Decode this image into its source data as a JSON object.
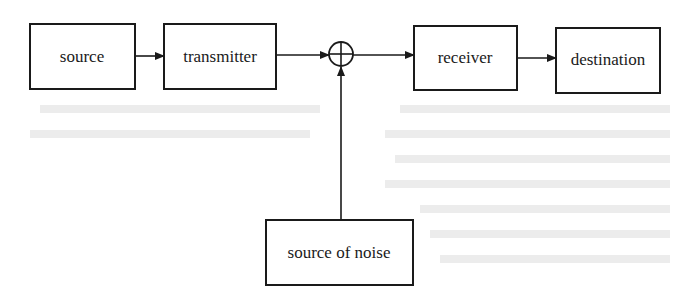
{
  "diagram": {
    "type": "block-diagram",
    "title": "",
    "colors": {
      "stroke": "#1a1a1a",
      "background": "#ffffff",
      "bleed_through_text": "#ececec"
    },
    "nodes": [
      {
        "id": "source",
        "label": "source",
        "x": 30,
        "y": 24,
        "w": 105,
        "h": 65
      },
      {
        "id": "transmitter",
        "label": "transmitter",
        "x": 164,
        "y": 24,
        "w": 112,
        "h": 65
      },
      {
        "id": "sum",
        "label": "",
        "shape": "summing-junction",
        "cx": 341,
        "cy": 54,
        "r": 12
      },
      {
        "id": "receiver",
        "label": "receiver",
        "x": 414,
        "y": 26,
        "w": 103,
        "h": 64
      },
      {
        "id": "destination",
        "label": "destination",
        "x": 556,
        "y": 28,
        "w": 104,
        "h": 65
      },
      {
        "id": "noise",
        "label": "source of noise",
        "x": 266,
        "y": 220,
        "w": 147,
        "h": 65
      }
    ],
    "edges": [
      {
        "from": "source",
        "to": "transmitter"
      },
      {
        "from": "transmitter",
        "to": "sum"
      },
      {
        "from": "sum",
        "to": "receiver"
      },
      {
        "from": "receiver",
        "to": "destination"
      },
      {
        "from": "noise",
        "to": "sum"
      }
    ]
  }
}
